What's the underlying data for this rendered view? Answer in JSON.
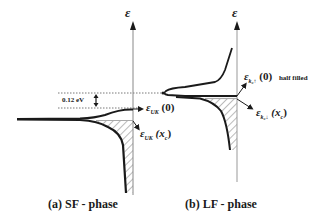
{
  "panels": [
    {
      "id": "a",
      "caption": "(a)  SF - phase",
      "axis_label": "ε",
      "gap_annotation": "0.12 eV",
      "level_upper": {
        "symbol": "ε",
        "subscript": "UK",
        "arg": "(0)"
      },
      "level_lower": {
        "symbol": "ε",
        "subscript": "UK",
        "arg": "(x",
        "arg_sub": "c",
        "arg_close": ")"
      }
    },
    {
      "id": "b",
      "caption": "(b)  LF - phase",
      "axis_label": "ε",
      "level_upper": {
        "symbol": "ε",
        "subscript": "k₀↑",
        "arg": "(0)",
        "note": "half filled"
      },
      "level_lower": {
        "symbol": "ε",
        "subscript": "k₀↓",
        "arg": "(x",
        "arg_sub": "c",
        "arg_close": ")"
      }
    }
  ],
  "colors": {
    "ink": "#1a1a1a",
    "axis": "#888888",
    "hatch": "#777777",
    "dotted": "#555555"
  }
}
